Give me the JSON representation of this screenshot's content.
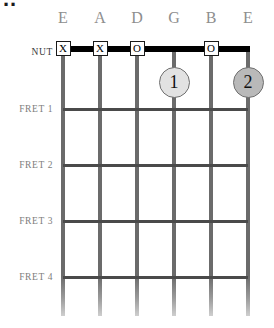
{
  "diagram": {
    "title_crop": "..",
    "nut_label": "NUT",
    "string_labels": [
      "E",
      "A",
      "D",
      "G",
      "B",
      "E"
    ],
    "fret_labels": [
      "FRET 1",
      "FRET 2",
      "FRET 3",
      "FRET 4"
    ],
    "nut_markers": [
      {
        "string": 1,
        "symbol": "X"
      },
      {
        "string": 2,
        "symbol": "X"
      },
      {
        "string": 3,
        "symbol": "O"
      },
      {
        "string": 5,
        "symbol": "O"
      }
    ],
    "finger_positions": [
      {
        "string": 4,
        "fret": 1,
        "finger": "1",
        "fill": "#e2e2e2"
      },
      {
        "string": 6,
        "fret": 1,
        "finger": "2",
        "fill": "#b9b9b9"
      }
    ],
    "colors": {
      "nut": "#000000",
      "fret": "#4a4a4a",
      "string": "#6b6b6b",
      "label": "#8e8e8e",
      "background": "#ffffff"
    }
  }
}
